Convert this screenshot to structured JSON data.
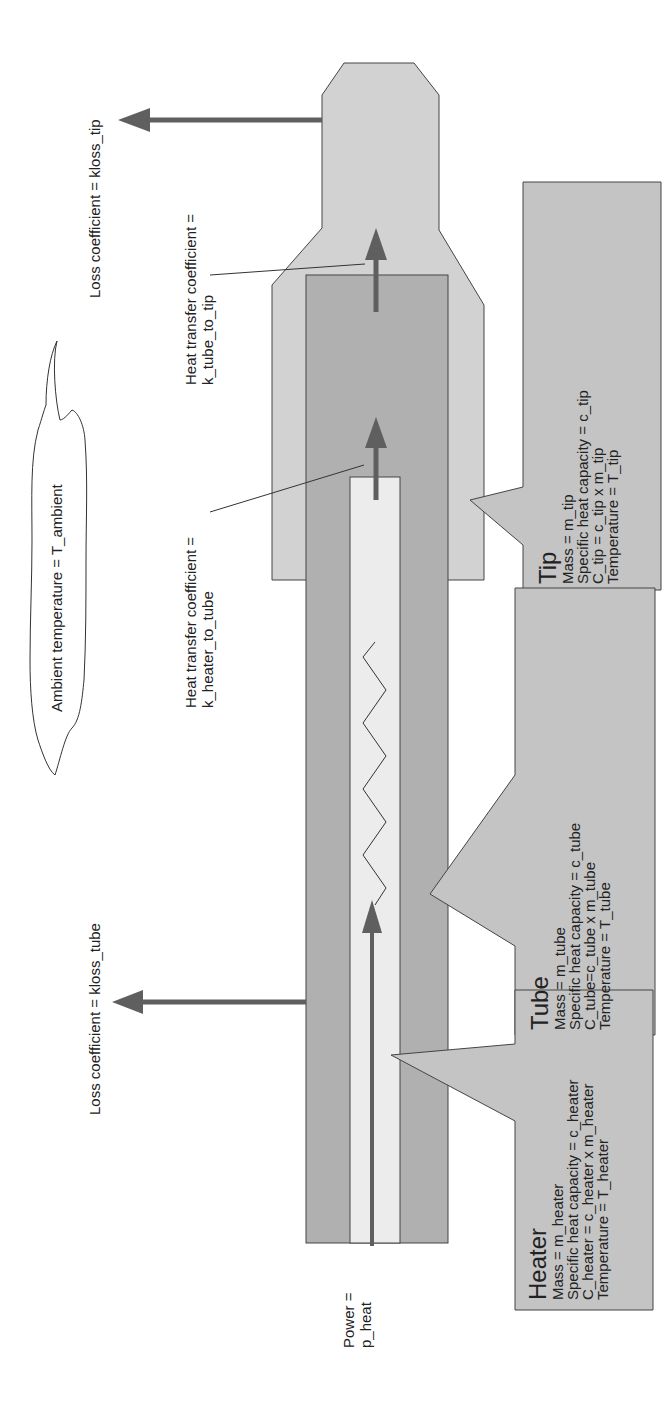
{
  "diagram": {
    "colors": {
      "tip_fill": "#d2d2d2",
      "tube_fill": "#b0b0b0",
      "heater_fill": "#ececec",
      "callout_fill": "#c4c4c4",
      "arrow": "#5f5f5f",
      "outline": "#444444"
    },
    "ambient": {
      "label": "Ambient temperature = T_ambient"
    },
    "loss_tip": {
      "label": "Loss coefficient = kloss_tip"
    },
    "loss_tube": {
      "label": "Loss coefficient = kloss_tube"
    },
    "k_tube_to_tip": {
      "line1": "Heat transfer coefficient =",
      "line2": "k_tube_to_tip"
    },
    "k_heater_to_tube": {
      "line1": "Heat transfer coefficient =",
      "line2": "k_heater_to_tube"
    },
    "power": {
      "line1": "Power =",
      "line2": "p_heat"
    },
    "callouts": {
      "tip": {
        "title": "Tip",
        "lines": [
          "Mass = m_tip",
          "Specific heat capacity = c_tip",
          "C_tip = c_tip x m_tip",
          "Temperature = T_tip"
        ]
      },
      "tube": {
        "title": "Tube",
        "lines": [
          "Mass = m_tube",
          "Specific heat capacity = c_tube",
          "C_tube=c_tube x m_tube",
          "Temperature = T_tube"
        ]
      },
      "heater": {
        "title": "Heater",
        "lines": [
          "Mass = m_heater",
          "Specific heat capacity = c_heater",
          "C_heater = c_heater x m_heater",
          "Temperature = T_heater"
        ]
      }
    }
  }
}
